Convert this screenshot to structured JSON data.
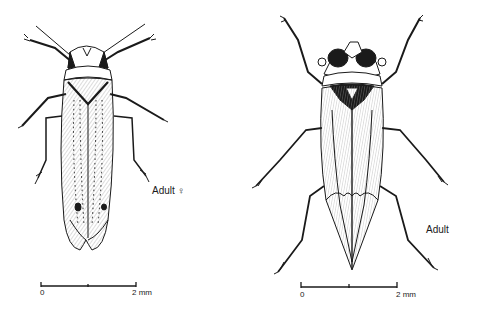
{
  "figure_left": {
    "label": "Adult ♀",
    "scale_bar": {
      "start_label": "0",
      "end_label": "2 mm"
    }
  },
  "figure_right": {
    "label": "Adult",
    "scale_bar": {
      "start_label": "0",
      "end_label": "2 mm"
    }
  },
  "colors": {
    "ink": "#1a1a1a",
    "background": "#ffffff",
    "hatch": "#8a8a8a"
  }
}
